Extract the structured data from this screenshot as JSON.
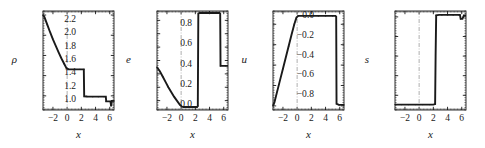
{
  "figure": {
    "background": "#ffffff",
    "ink": "#1a1a1a",
    "panel_count": 4
  },
  "chart_data": [
    {
      "type": "line",
      "title": "",
      "xlabel": "x",
      "ylabel": "ρ",
      "xlim": [
        -3.4,
        6.6
      ],
      "ylim": [
        0.6,
        10.4
      ],
      "xticks": [
        -2,
        0,
        2,
        4,
        6
      ],
      "xtick_labels": [
        "−2",
        "0",
        "2",
        "4",
        "6"
      ],
      "yticks": [
        2,
        4,
        6,
        8,
        10
      ],
      "ytick_labels": [
        "2",
        "4",
        "6",
        "8",
        "10"
      ],
      "grid": false,
      "vertical_marker_x": 0,
      "legend": "none",
      "series": [
        {
          "name": "rho",
          "x": [
            -3.4,
            -3.2,
            -2.8,
            -2.4,
            -2.0,
            -1.6,
            -1.2,
            -0.8,
            -0.4,
            -0.1,
            0.2,
            0.6,
            1.0,
            1.4,
            1.8,
            2.2,
            2.35,
            2.4,
            2.8,
            3.2,
            3.6,
            4.0,
            4.4,
            4.8,
            5.2,
            5.45,
            5.5,
            5.9,
            6.1,
            6.2,
            6.3,
            6.5,
            6.6
          ],
          "y": [
            10.0,
            9.8,
            9.05,
            8.3,
            7.6,
            6.95,
            6.3,
            5.7,
            5.15,
            4.75,
            4.62,
            4.62,
            4.62,
            4.62,
            4.62,
            4.62,
            4.62,
            1.95,
            1.93,
            1.92,
            1.92,
            1.92,
            1.92,
            1.92,
            1.92,
            1.92,
            1.45,
            1.45,
            1.45,
            0.95,
            1.5,
            1.5,
            1.5
          ]
        }
      ]
    },
    {
      "type": "line",
      "title": "",
      "xlabel": "x",
      "ylabel": "e",
      "xlim": [
        -3.4,
        6.6
      ],
      "ylim": [
        0.86,
        2.34
      ],
      "xticks": [
        -2,
        0,
        2,
        4,
        6
      ],
      "xtick_labels": [
        "−2",
        "0",
        "2",
        "4",
        "6"
      ],
      "yticks": [
        1.0,
        1.2,
        1.4,
        1.6,
        1.8,
        2.0,
        2.2
      ],
      "ytick_labels": [
        "1.0",
        "1.2",
        "1.4",
        "1.6",
        "1.8",
        "2.0",
        "2.2"
      ],
      "grid": false,
      "vertical_marker_x": 0,
      "legend": "none",
      "series": [
        {
          "name": "e",
          "x": [
            -3.4,
            -3.0,
            -2.6,
            -2.2,
            -1.8,
            -1.4,
            -1.0,
            -0.6,
            -0.2,
            0.1,
            0.35,
            0.7,
            1.1,
            1.5,
            1.9,
            2.25,
            2.35,
            2.42,
            2.6,
            3.0,
            3.5,
            4.0,
            4.5,
            5.0,
            5.4,
            5.5,
            5.55,
            5.9,
            6.3,
            6.6
          ],
          "y": [
            1.5,
            1.44,
            1.36,
            1.28,
            1.2,
            1.13,
            1.06,
            1.0,
            0.94,
            0.91,
            0.905,
            0.905,
            0.905,
            0.905,
            0.905,
            0.905,
            0.92,
            2.3,
            2.31,
            2.31,
            2.31,
            2.31,
            2.31,
            2.31,
            2.31,
            2.3,
            1.52,
            1.52,
            1.52,
            1.52
          ]
        }
      ]
    },
    {
      "type": "line",
      "title": "",
      "xlabel": "x",
      "ylabel": "u",
      "xlim": [
        -3.4,
        6.6
      ],
      "ylim": [
        -0.04,
        0.93
      ],
      "xticks": [
        -2,
        0,
        2,
        4,
        6
      ],
      "xtick_labels": [
        "−2",
        "0",
        "2",
        "4",
        "6"
      ],
      "yticks": [
        0.0,
        0.2,
        0.4,
        0.6,
        0.8
      ],
      "ytick_labels": [
        "0.0",
        "0.2",
        "0.4",
        "0.6",
        "0.8"
      ],
      "grid": false,
      "vertical_marker_x": 0,
      "legend": "none",
      "series": [
        {
          "name": "u",
          "x": [
            -3.4,
            -3.2,
            -2.8,
            -2.4,
            -2.0,
            -1.6,
            -1.2,
            -0.8,
            -0.4,
            -0.1,
            0.15,
            0.4,
            0.9,
            1.5,
            2.0,
            2.5,
            3.0,
            3.5,
            4.0,
            4.5,
            5.0,
            5.4,
            5.5,
            5.55,
            5.9,
            6.3,
            6.6
          ],
          "y": [
            0.0,
            0.035,
            0.145,
            0.255,
            0.365,
            0.475,
            0.585,
            0.695,
            0.8,
            0.865,
            0.882,
            0.882,
            0.882,
            0.882,
            0.882,
            0.882,
            0.882,
            0.882,
            0.882,
            0.882,
            0.882,
            0.882,
            0.875,
            0.02,
            0.01,
            0.01,
            0.01
          ]
        }
      ]
    },
    {
      "type": "line",
      "title": "",
      "xlabel": "x",
      "ylabel": "s",
      "xlim": [
        -3.4,
        6.6
      ],
      "ylim": [
        -0.95,
        0.06
      ],
      "xticks": [
        -2,
        0,
        2,
        4,
        6
      ],
      "xtick_labels": [
        "−2",
        "0",
        "2",
        "4",
        "6"
      ],
      "yticks": [
        0.0,
        -0.2,
        -0.4,
        -0.6,
        -0.8
      ],
      "ytick_labels": [
        "0.0",
        "−0.2",
        "−0.4",
        "−0.6",
        "−0.8"
      ],
      "grid": false,
      "vertical_marker_x": 0,
      "legend": "none",
      "series": [
        {
          "name": "s",
          "x": [
            -3.4,
            -3.0,
            -2.5,
            -2.0,
            -1.5,
            -1.0,
            -0.5,
            0.0,
            0.5,
            1.0,
            1.5,
            2.0,
            2.25,
            2.32,
            2.4,
            2.8,
            3.2,
            3.6,
            4.0,
            4.4,
            4.8,
            5.2,
            5.6,
            5.75,
            5.85,
            6.1,
            6.3,
            6.6
          ],
          "y": [
            -0.895,
            -0.895,
            -0.895,
            -0.895,
            -0.895,
            -0.895,
            -0.895,
            -0.895,
            -0.895,
            -0.895,
            -0.895,
            -0.895,
            -0.89,
            -0.4,
            0.015,
            0.02,
            0.02,
            0.02,
            0.02,
            0.02,
            0.02,
            0.02,
            0.02,
            0.02,
            -0.02,
            -0.02,
            0.015,
            0.015
          ]
        }
      ]
    }
  ]
}
